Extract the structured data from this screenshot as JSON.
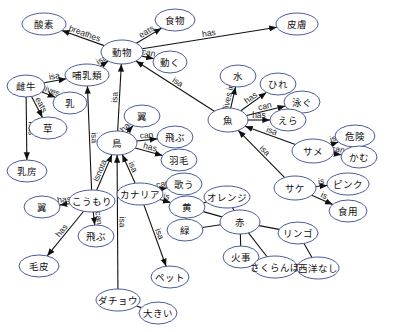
{
  "diagram": {
    "title": "",
    "nodes": [
      {
        "id": "sanso",
        "label": "酸素",
        "x": 44,
        "y": 24,
        "rx": 22,
        "ry": 11
      },
      {
        "id": "shokumotsu",
        "label": "食物",
        "x": 175,
        "y": 20,
        "rx": 20,
        "ry": 11
      },
      {
        "id": "hifu",
        "label": "皮膚",
        "x": 297,
        "y": 24,
        "rx": 21,
        "ry": 11
      },
      {
        "id": "doubutsu",
        "label": "動物",
        "x": 122,
        "y": 52,
        "rx": 21,
        "ry": 12
      },
      {
        "id": "ugoku",
        "label": "動く",
        "x": 170,
        "y": 62,
        "rx": 17,
        "ry": 11
      },
      {
        "id": "honyurui",
        "label": "哺乳類",
        "x": 87,
        "y": 75,
        "rx": 22,
        "ry": 11
      },
      {
        "id": "meushi",
        "label": "雌牛",
        "x": 26,
        "y": 86,
        "rx": 19,
        "ry": 11
      },
      {
        "id": "chichi",
        "label": "乳",
        "x": 70,
        "y": 103,
        "rx": 17,
        "ry": 11
      },
      {
        "id": "kusa",
        "label": "草",
        "x": 48,
        "y": 128,
        "rx": 19,
        "ry": 11
      },
      {
        "id": "nyubou",
        "label": "乳房",
        "x": 27,
        "y": 171,
        "rx": 20,
        "ry": 11
      },
      {
        "id": "mizu",
        "label": "水",
        "x": 238,
        "y": 76,
        "rx": 18,
        "ry": 11
      },
      {
        "id": "hire",
        "label": "ひれ",
        "x": 278,
        "y": 84,
        "rx": 18,
        "ry": 11
      },
      {
        "id": "oyogu",
        "label": "泳ぐ",
        "x": 302,
        "y": 102,
        "rx": 18,
        "ry": 11
      },
      {
        "id": "sakana",
        "label": "魚",
        "x": 228,
        "y": 120,
        "rx": 20,
        "ry": 12
      },
      {
        "id": "era",
        "label": "えら",
        "x": 288,
        "y": 120,
        "rx": 18,
        "ry": 11
      },
      {
        "id": "tsubasa1",
        "label": "翼",
        "x": 142,
        "y": 116,
        "rx": 18,
        "ry": 11
      },
      {
        "id": "tobu1",
        "label": "飛ぶ",
        "x": 175,
        "y": 137,
        "rx": 18,
        "ry": 11
      },
      {
        "id": "tori",
        "label": "鳥",
        "x": 117,
        "y": 143,
        "rx": 20,
        "ry": 12
      },
      {
        "id": "umou",
        "label": "羽毛",
        "x": 179,
        "y": 160,
        "rx": 18,
        "ry": 11
      },
      {
        "id": "kiken",
        "label": "危険",
        "x": 355,
        "y": 136,
        "rx": 20,
        "ry": 11
      },
      {
        "id": "same",
        "label": "サメ",
        "x": 313,
        "y": 151,
        "rx": 21,
        "ry": 12
      },
      {
        "id": "kamu",
        "label": "かむ",
        "x": 359,
        "y": 157,
        "rx": 18,
        "ry": 11
      },
      {
        "id": "kanaria",
        "label": "カナリア",
        "x": 140,
        "y": 194,
        "rx": 23,
        "ry": 11
      },
      {
        "id": "utau",
        "label": "歌う",
        "x": 184,
        "y": 184,
        "rx": 18,
        "ry": 11
      },
      {
        "id": "ki",
        "label": "黄",
        "x": 187,
        "y": 207,
        "rx": 18,
        "ry": 11
      },
      {
        "id": "orenji",
        "label": "オレンジ",
        "x": 227,
        "y": 197,
        "rx": 23,
        "ry": 11
      },
      {
        "id": "midori",
        "label": "緑",
        "x": 185,
        "y": 230,
        "rx": 18,
        "ry": 11
      },
      {
        "id": "aka",
        "label": "赤",
        "x": 240,
        "y": 222,
        "rx": 20,
        "ry": 12
      },
      {
        "id": "pinku",
        "label": "ピンク",
        "x": 348,
        "y": 184,
        "rx": 21,
        "ry": 11
      },
      {
        "id": "sake",
        "label": "サケ",
        "x": 295,
        "y": 188,
        "rx": 21,
        "ry": 12
      },
      {
        "id": "shokuyou",
        "label": "食用",
        "x": 348,
        "y": 211,
        "rx": 19,
        "ry": 11
      },
      {
        "id": "tsubasa2",
        "label": "翼",
        "x": 42,
        "y": 207,
        "rx": 18,
        "ry": 11
      },
      {
        "id": "koumori",
        "label": "こうもり",
        "x": 92,
        "y": 201,
        "rx": 23,
        "ry": 11
      },
      {
        "id": "tobu2",
        "label": "飛ぶ",
        "x": 96,
        "y": 236,
        "rx": 18,
        "ry": 11
      },
      {
        "id": "kegawa",
        "label": "毛皮",
        "x": 39,
        "y": 266,
        "rx": 20,
        "ry": 11
      },
      {
        "id": "ringo",
        "label": "リンゴ",
        "x": 298,
        "y": 233,
        "rx": 20,
        "ry": 11
      },
      {
        "id": "kaji",
        "label": "火事",
        "x": 241,
        "y": 257,
        "rx": 18,
        "ry": 11
      },
      {
        "id": "sakuranbo",
        "label": "さくらんぼ",
        "x": 275,
        "y": 267,
        "rx": 22,
        "ry": 11
      },
      {
        "id": "seiyounashi",
        "label": "西洋なし",
        "x": 318,
        "y": 268,
        "rx": 21,
        "ry": 11
      },
      {
        "id": "petto",
        "label": "ペット",
        "x": 170,
        "y": 277,
        "rx": 19,
        "ry": 11
      },
      {
        "id": "dachou",
        "label": "ダチョウ",
        "x": 118,
        "y": 300,
        "rx": 22,
        "ry": 11
      },
      {
        "id": "ookii",
        "label": "大きい",
        "x": 158,
        "y": 313,
        "rx": 19,
        "ry": 11
      }
    ],
    "edges": [
      {
        "from": "doubutsu",
        "to": "sanso",
        "label": "breathes",
        "directed": true
      },
      {
        "from": "doubutsu",
        "to": "shokumotsu",
        "label": "eats",
        "directed": true
      },
      {
        "from": "doubutsu",
        "to": "hifu",
        "label": "has",
        "directed": true
      },
      {
        "from": "doubutsu",
        "to": "ugoku",
        "label": "can",
        "directed": true
      },
      {
        "from": "honyurui",
        "to": "doubutsu",
        "label": "isa",
        "directed": true
      },
      {
        "from": "meushi",
        "to": "honyurui",
        "label": "isa",
        "directed": true
      },
      {
        "from": "meushi",
        "to": "chichi",
        "label": "gives",
        "directed": true
      },
      {
        "from": "meushi",
        "to": "kusa",
        "label": "eats",
        "directed": true
      },
      {
        "from": "meushi",
        "to": "nyubou",
        "label": "has",
        "directed": true
      },
      {
        "from": "tori",
        "to": "doubutsu",
        "label": "isa",
        "directed": true
      },
      {
        "from": "sakana",
        "to": "doubutsu",
        "label": "isa",
        "directed": true
      },
      {
        "from": "sakana",
        "to": "mizu",
        "label": "lives in",
        "directed": true
      },
      {
        "from": "sakana",
        "to": "hire",
        "label": "has",
        "directed": true
      },
      {
        "from": "sakana",
        "to": "oyogu",
        "label": "can",
        "directed": true
      },
      {
        "from": "sakana",
        "to": "era",
        "label": "has",
        "directed": true
      },
      {
        "from": "tori",
        "to": "tsubasa1",
        "label": "has",
        "directed": true
      },
      {
        "from": "tori",
        "to": "tobu1",
        "label": "can",
        "directed": true
      },
      {
        "from": "tori",
        "to": "umou",
        "label": "has",
        "directed": true
      },
      {
        "from": "same",
        "to": "sakana",
        "label": "isa",
        "directed": true
      },
      {
        "from": "same",
        "to": "kiken",
        "label": "is",
        "directed": true
      },
      {
        "from": "same",
        "to": "kamu",
        "label": "can",
        "directed": true
      },
      {
        "from": "sake",
        "to": "sakana",
        "label": "isa",
        "directed": true
      },
      {
        "from": "sake",
        "to": "pinku",
        "label": "is",
        "directed": true
      },
      {
        "from": "sake",
        "to": "shokuyou",
        "label": "is",
        "directed": true
      },
      {
        "from": "kanaria",
        "to": "tori",
        "label": "isa",
        "directed": true
      },
      {
        "from": "kanaria",
        "to": "utau",
        "label": "can",
        "directed": true
      },
      {
        "from": "kanaria",
        "to": "ki",
        "label": "is",
        "directed": true
      },
      {
        "from": "kanaria",
        "to": "petto",
        "label": "isa",
        "directed": true
      },
      {
        "from": "koumori",
        "to": "honyurui",
        "label": "isa",
        "directed": true
      },
      {
        "from": "koumori",
        "to": "tori",
        "label": "isnota",
        "directed": true
      },
      {
        "from": "koumori",
        "to": "tsubasa2",
        "label": "has",
        "directed": true
      },
      {
        "from": "koumori",
        "to": "tobu2",
        "label": "can",
        "directed": true
      },
      {
        "from": "koumori",
        "to": "kegawa",
        "label": "has",
        "directed": true
      },
      {
        "from": "dachou",
        "to": "tori",
        "label": "isa",
        "directed": true
      },
      {
        "from": "dachou",
        "to": "ookii",
        "label": "",
        "directed": false
      },
      {
        "from": "ki",
        "to": "orenji",
        "label": "",
        "directed": false
      },
      {
        "from": "ki",
        "to": "midori",
        "label": "",
        "directed": false
      },
      {
        "from": "ki",
        "to": "aka",
        "label": "",
        "directed": false
      },
      {
        "from": "orenji",
        "to": "aka",
        "label": "",
        "directed": false
      },
      {
        "from": "midori",
        "to": "aka",
        "label": "",
        "directed": false
      },
      {
        "from": "aka",
        "to": "ringo",
        "label": "",
        "directed": false
      },
      {
        "from": "aka",
        "to": "kaji",
        "label": "",
        "directed": false
      },
      {
        "from": "aka",
        "to": "sakuranbo",
        "label": "",
        "directed": false
      },
      {
        "from": "ringo",
        "to": "seiyounashi",
        "label": "",
        "directed": false
      },
      {
        "from": "sakuranbo",
        "to": "seiyounashi",
        "label": "",
        "directed": false
      }
    ]
  },
  "colors": {
    "node_stroke": "#4a5c9a",
    "edge": "#111111",
    "background": "#ffffff"
  }
}
